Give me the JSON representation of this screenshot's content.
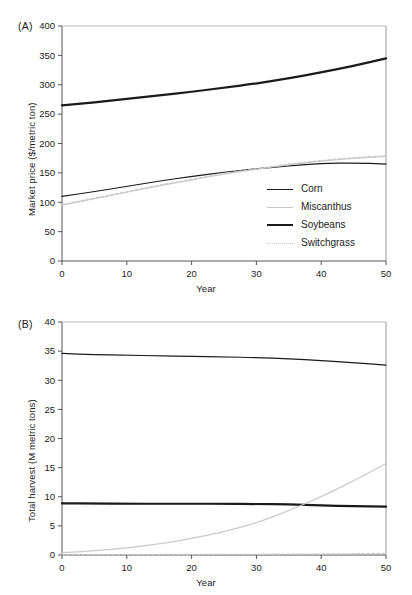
{
  "figure": {
    "panels": [
      {
        "tag": "(A)",
        "ylabel": "Market price ($/metric ton)",
        "xlabel": "Year"
      },
      {
        "tag": "(B)",
        "ylabel": "Total harvest (M metric tons)",
        "xlabel": "Year"
      }
    ],
    "legend": {
      "entries": [
        {
          "label": "Corn",
          "key": "corn-line-key",
          "color": "#1a1a1a",
          "style": "solid-thin"
        },
        {
          "label": "Miscanthus",
          "key": "miscanthus-line-key",
          "color": "#c9c9c9",
          "style": "solid-thin"
        },
        {
          "label": "Soybeans",
          "key": "soybeans-line-key",
          "color": "#1a1a1a",
          "style": "solid-thick"
        },
        {
          "label": "Switchgrass",
          "key": "switchgrass-line-key",
          "color": "#c9c9c9",
          "style": "dotted"
        }
      ]
    }
  },
  "chart_data": [
    {
      "type": "line",
      "panel": "(A)",
      "title": "",
      "xlabel": "Year",
      "ylabel": "Market price ($/metric ton)",
      "xlim": [
        0,
        50
      ],
      "ylim": [
        0,
        400
      ],
      "xticks": [
        0,
        10,
        20,
        30,
        40,
        50
      ],
      "yticks": [
        0,
        50,
        100,
        150,
        200,
        250,
        300,
        350,
        400
      ],
      "grid": false,
      "legend_position": "inside-lower-right",
      "x": [
        0,
        5,
        10,
        15,
        20,
        25,
        30,
        35,
        40,
        45,
        50
      ],
      "series": [
        {
          "name": "Soybeans",
          "color": "#1a1a1a",
          "style": "solid-thick",
          "values": [
            265,
            270,
            276,
            282,
            288,
            295,
            302,
            311,
            321,
            332,
            345
          ]
        },
        {
          "name": "Corn",
          "color": "#1a1a1a",
          "style": "solid-thin",
          "values": [
            110,
            118,
            127,
            136,
            144,
            151,
            157,
            162,
            166,
            167,
            165
          ]
        },
        {
          "name": "Miscanthus",
          "color": "#c9c9c9",
          "style": "solid-thin",
          "values": [
            95,
            106,
            117,
            128,
            138,
            148,
            156,
            164,
            170,
            175,
            178
          ]
        },
        {
          "name": "Switchgrass",
          "color": "#c9c9c9",
          "style": "dotted",
          "values": [
            96,
            107,
            118,
            129,
            139,
            149,
            157,
            165,
            171,
            176,
            179
          ]
        }
      ]
    },
    {
      "type": "line",
      "panel": "(B)",
      "title": "",
      "xlabel": "Year",
      "ylabel": "Total harvest (M metric tons)",
      "xlim": [
        0,
        50
      ],
      "ylim": [
        0,
        40
      ],
      "xticks": [
        0,
        10,
        20,
        30,
        40,
        50
      ],
      "yticks": [
        0,
        5,
        10,
        15,
        20,
        25,
        30,
        35,
        40
      ],
      "grid": false,
      "legend_position": "none",
      "x": [
        0,
        5,
        10,
        15,
        20,
        25,
        30,
        35,
        40,
        45,
        50
      ],
      "series": [
        {
          "name": "Corn",
          "color": "#1a1a1a",
          "style": "solid-thin",
          "values": [
            34.6,
            34.4,
            34.3,
            34.2,
            34.1,
            34.0,
            33.9,
            33.7,
            33.4,
            33.0,
            32.6
          ]
        },
        {
          "name": "Soybeans",
          "color": "#1a1a1a",
          "style": "solid-thick",
          "values": [
            8.85,
            8.85,
            8.8,
            8.8,
            8.8,
            8.8,
            8.75,
            8.7,
            8.5,
            8.4,
            8.3
          ]
        },
        {
          "name": "Miscanthus",
          "color": "#c9c9c9",
          "style": "solid-thin",
          "values": [
            0.4,
            0.7,
            1.2,
            1.9,
            2.8,
            4.0,
            5.5,
            7.6,
            10.0,
            12.7,
            15.7
          ]
        },
        {
          "name": "Switchgrass",
          "color": "#c9c9c9",
          "style": "dotted",
          "values": [
            0.05,
            0.06,
            0.07,
            0.08,
            0.09,
            0.1,
            0.12,
            0.14,
            0.17,
            0.2,
            0.3
          ]
        }
      ]
    }
  ]
}
